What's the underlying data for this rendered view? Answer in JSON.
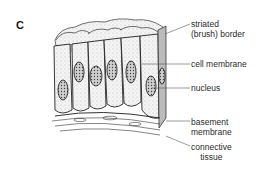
{
  "figure": {
    "panel_letter": "C",
    "labels": [
      {
        "line1": "striated",
        "line2": "(brush) border"
      },
      {
        "line1": "cell membrane"
      },
      {
        "line1": "nucleus"
      },
      {
        "line1": "basement",
        "line2": "membrane"
      },
      {
        "line1": "connective",
        "line2": "tissue"
      }
    ],
    "colors": {
      "ink": "#1a1a1a",
      "background": "#ffffff"
    }
  }
}
